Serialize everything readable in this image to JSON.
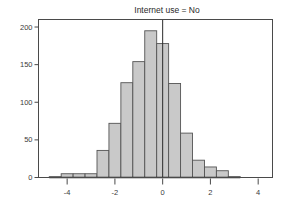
{
  "chart_data": {
    "type": "bar",
    "title": "Internet use = No",
    "xlabel": "",
    "ylabel": "",
    "xlim": [
      -5.2,
      4.6
    ],
    "ylim": [
      0,
      210
    ],
    "grid": false,
    "legend": null,
    "bin_width": 0.5,
    "x_ticks": [
      -4,
      -2,
      0,
      2,
      4
    ],
    "x_tick_labels": [
      "-4",
      "-2",
      "0",
      "2",
      "4"
    ],
    "y_ticks": [
      0,
      50,
      100,
      150,
      200
    ],
    "y_tick_labels": [
      "0",
      "50",
      "100",
      "150",
      "200"
    ],
    "reference_line_x": 0,
    "bin_starts": [
      -4.75,
      -4.25,
      -3.75,
      -3.25,
      -2.75,
      -2.25,
      -1.75,
      -1.25,
      -0.75,
      -0.25,
      0.25,
      0.75,
      1.25,
      1.75,
      2.25,
      2.75
    ],
    "bin_centers": [
      -4.5,
      -4.0,
      -3.5,
      -3.0,
      -2.5,
      -2.0,
      -1.5,
      -1.0,
      -0.5,
      0.0,
      0.5,
      1.0,
      1.5,
      2.0,
      2.5,
      3.0
    ],
    "values": [
      1,
      5,
      5,
      5,
      36,
      72,
      126,
      154,
      195,
      178,
      125,
      59,
      23,
      14,
      9,
      1
    ],
    "colors": {
      "bar_fill": "#c9c9c9",
      "bar_stroke": "#545454",
      "frame": "#4a4a4a",
      "reference_line": "#2b2b2b",
      "text": "#2a2a2a",
      "background": "#ffffff"
    }
  }
}
